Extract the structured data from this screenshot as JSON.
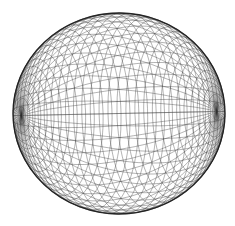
{
  "figure": {
    "background_color": "#ffffff"
  },
  "sphere": {
    "center_x": 119,
    "center_y": 113.5,
    "radius_x": 106,
    "radius_y": 100.5,
    "axis": [
      0.92,
      0.02,
      0.39
    ],
    "meridians": 48,
    "parallels": 36,
    "mesh_color": "#2e2e2e",
    "mesh_opacity": 0.72,
    "mesh_stroke_width": 0.5,
    "outline_color": "#1a1a1a",
    "outline_stroke_width": 1.3,
    "outline_opacity": 0.9
  }
}
